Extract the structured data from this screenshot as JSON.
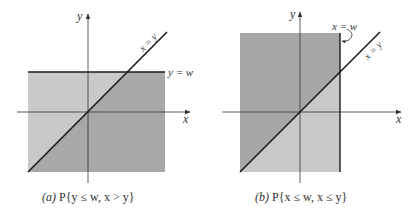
{
  "colors": {
    "shade_dark": "#a6a6a6",
    "shade_light": "#c8c8c8",
    "line": "#1a1a1a",
    "axis": "#333333"
  },
  "panels": [
    {
      "id": "a",
      "axis_labels": {
        "x": "x",
        "y": "y"
      },
      "line_labels": {
        "diagonal": "x = y",
        "boundary": "y = w"
      },
      "caption": {
        "tag": "(a)",
        "text": "P{y ≤ w, x > y}"
      },
      "region": "y ≤ w; darker where x > y"
    },
    {
      "id": "b",
      "axis_labels": {
        "x": "x",
        "y": "y"
      },
      "line_labels": {
        "diagonal": "x = y",
        "boundary": "x = w"
      },
      "caption": {
        "tag": "(b)",
        "text": "P{x ≤ w, x ≤ y}"
      },
      "region": "x ≤ w; darker where x ≤ y"
    }
  ]
}
